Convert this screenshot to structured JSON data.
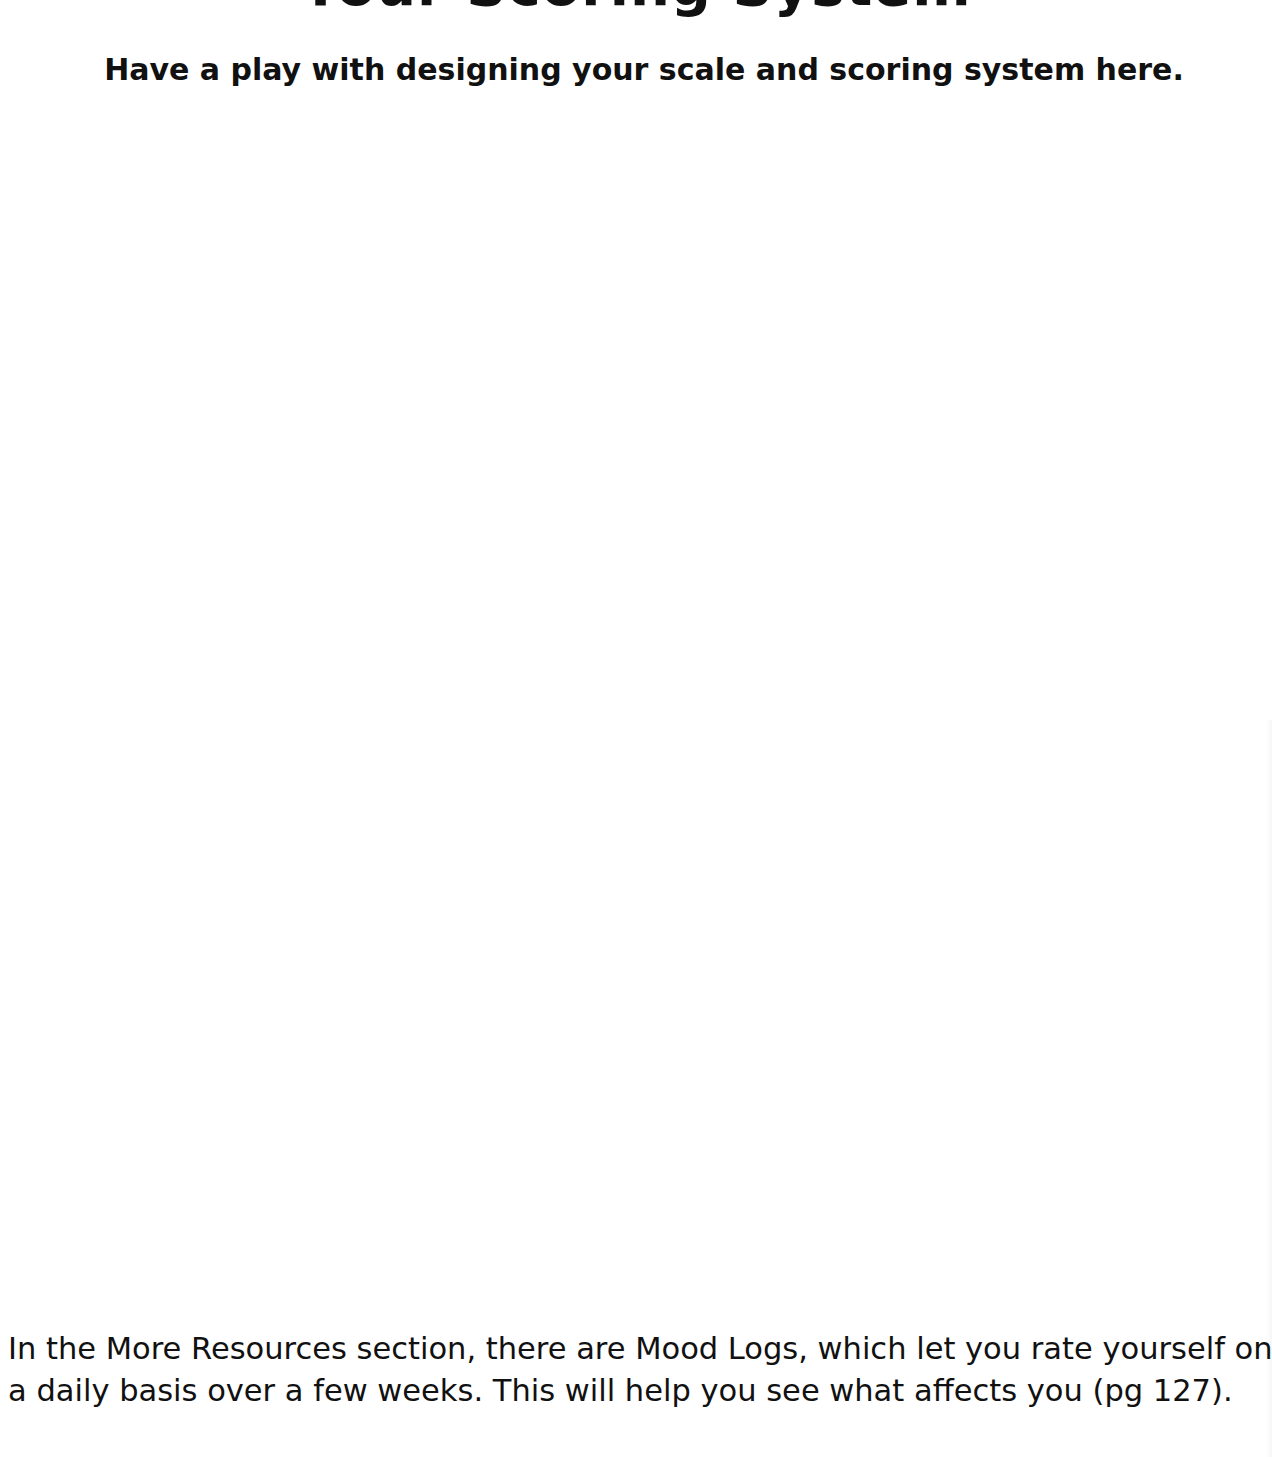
{
  "page": {
    "title": "Your Scoring System",
    "subtitle": "Have a play with designing your scale and scoring system here.",
    "body_lines": [
      "In the More Resources section, there are Mood Logs, which let you rate yourself on",
      "a daily basis over a few weeks. This will help you see what affects you (pg 127)."
    ]
  }
}
